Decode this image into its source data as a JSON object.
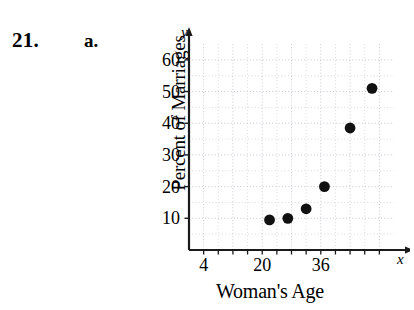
{
  "problem": {
    "number": "21.",
    "part": "a."
  },
  "chart_data": {
    "type": "scatter",
    "title": "",
    "xlabel": "Woman's Age",
    "ylabel": "Percent of Marriages",
    "x_axis_variable": "x",
    "y_axis_variable": "y",
    "xlim": [
      0,
      56
    ],
    "ylim": [
      0,
      65
    ],
    "grid": true,
    "grid_x_step": 4,
    "grid_y_step": 5,
    "xticks": [
      "4",
      "20",
      "36"
    ],
    "xtick_values": [
      4,
      20,
      36
    ],
    "yticks": [
      "10",
      "20",
      "30",
      "40",
      "50",
      "60"
    ],
    "ytick_values": [
      10,
      20,
      30,
      40,
      50,
      60
    ],
    "legend": "",
    "legend_position": "none",
    "marker": "filled-circle",
    "marker_color": "#111111",
    "points": [
      {
        "x": 22,
        "y": 9.5
      },
      {
        "x": 27,
        "y": 10
      },
      {
        "x": 32,
        "y": 13
      },
      {
        "x": 37,
        "y": 20
      },
      {
        "x": 44,
        "y": 38.5
      },
      {
        "x": 50,
        "y": 51
      }
    ]
  },
  "colors": {
    "ink": "#111111",
    "grid": "#b9b9c4",
    "axis": "#1a1a1a",
    "background": "#ffffff"
  }
}
